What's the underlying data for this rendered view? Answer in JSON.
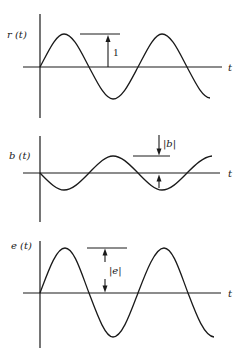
{
  "figure": {
    "panels": [
      {
        "id": "r",
        "y_label": "r (t)",
        "x_label": "t",
        "annotation": "1",
        "waveform": "sine",
        "phase": "starts rising at origin",
        "relative_amplitude": 1
      },
      {
        "id": "b",
        "y_label": "b (t)",
        "x_label": "t",
        "annotation": "|b|",
        "waveform": "sine",
        "phase": "starts falling at origin (inverted)",
        "relative_amplitude": 0.5
      },
      {
        "id": "e",
        "y_label": "e (t)",
        "x_label": "t",
        "annotation": "|e|",
        "waveform": "sine",
        "phase": "starts rising at origin",
        "relative_amplitude": 1.4
      }
    ]
  }
}
